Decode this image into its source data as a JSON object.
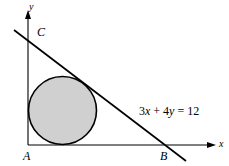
{
  "figure": {
    "type": "geometry-diagram",
    "background_color": "#ffffff",
    "stroke_color": "#000000",
    "circle_fill_color": "#d0d0d0",
    "axis_color": "#000000",
    "labels": {
      "y_axis": "y",
      "x_axis": "x",
      "point_C": "C",
      "point_A": "A",
      "point_B": "B"
    },
    "equation": {
      "full": "3x + 4y = 12",
      "coef_x": "3",
      "var_x": "x",
      "plus": " + ",
      "coef_y": "4",
      "var_y": "y",
      "equals": " = ",
      "constant": "12"
    },
    "geometry": {
      "origin": [
        28,
        145
      ],
      "y_axis_top": [
        28,
        12
      ],
      "x_axis_right": [
        215,
        145
      ],
      "line_start": [
        14,
        30
      ],
      "line_end": [
        186,
        161
      ],
      "circle_center": [
        62.5,
        110.5
      ],
      "circle_radius": 34.5,
      "tangent_point": [
        95,
        87
      ]
    }
  }
}
